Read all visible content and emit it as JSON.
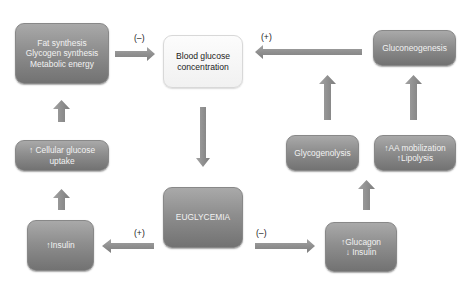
{
  "diagram": {
    "title": "",
    "nodes": {
      "fat_synthesis": {
        "lines": [
          "Fat synthesis",
          "Glycogen synthesis",
          "Metabolic energy"
        ]
      },
      "blood_glucose": {
        "lines": [
          "Blood glucose",
          "concentration"
        ]
      },
      "gluconeogenesis": {
        "lines": [
          "Gluconeogenesis"
        ]
      },
      "cellular_uptake": {
        "lines": [
          "↑ Cellular glucose",
          "uptake"
        ]
      },
      "glycogenolysis": {
        "lines": [
          "Glycogenolysis"
        ]
      },
      "aa_mobilization": {
        "lines": [
          "↑AA mobilization",
          "↑Lipolysis"
        ]
      },
      "euglycemia": {
        "lines": [
          "EUGLYCEMIA"
        ]
      },
      "insulin_up": {
        "lines": [
          "↑Insulin"
        ]
      },
      "glucagon_insulin": {
        "lines": [
          "↑Glucagon",
          "↓ Insulin"
        ]
      }
    },
    "edge_labels": {
      "fat_to_glucose": "(–)",
      "gluconeo_to_glucose": "(+)",
      "eugly_to_insulin": "(+)",
      "eugly_to_glucagon": "(–)"
    },
    "edges": [
      {
        "from": "fat_synthesis",
        "to": "blood_glucose",
        "label": "(–)"
      },
      {
        "from": "gluconeogenesis",
        "to": "blood_glucose",
        "label": "(+)"
      },
      {
        "from": "blood_glucose",
        "to": "euglycemia",
        "label": ""
      },
      {
        "from": "euglycemia",
        "to": "insulin_up",
        "label": "(+)"
      },
      {
        "from": "euglycemia",
        "to": "glucagon_insulin",
        "label": "(–)"
      },
      {
        "from": "insulin_up",
        "to": "cellular_uptake",
        "label": ""
      },
      {
        "from": "cellular_uptake",
        "to": "fat_synthesis",
        "label": ""
      },
      {
        "from": "glucagon_insulin",
        "to": "aa_mobilization",
        "label": ""
      },
      {
        "from": "glycogenolysis",
        "to": "gluconeogenesis",
        "label": ""
      },
      {
        "from": "aa_mobilization",
        "to": "gluconeogenesis",
        "label": ""
      }
    ],
    "colors": {
      "dark_box_top": "#a9a9a9",
      "dark_box_bottom": "#727272",
      "light_box": "#f5f5f5",
      "arrow": "#8f8f8f",
      "box_text": "#f2f2f2"
    }
  }
}
